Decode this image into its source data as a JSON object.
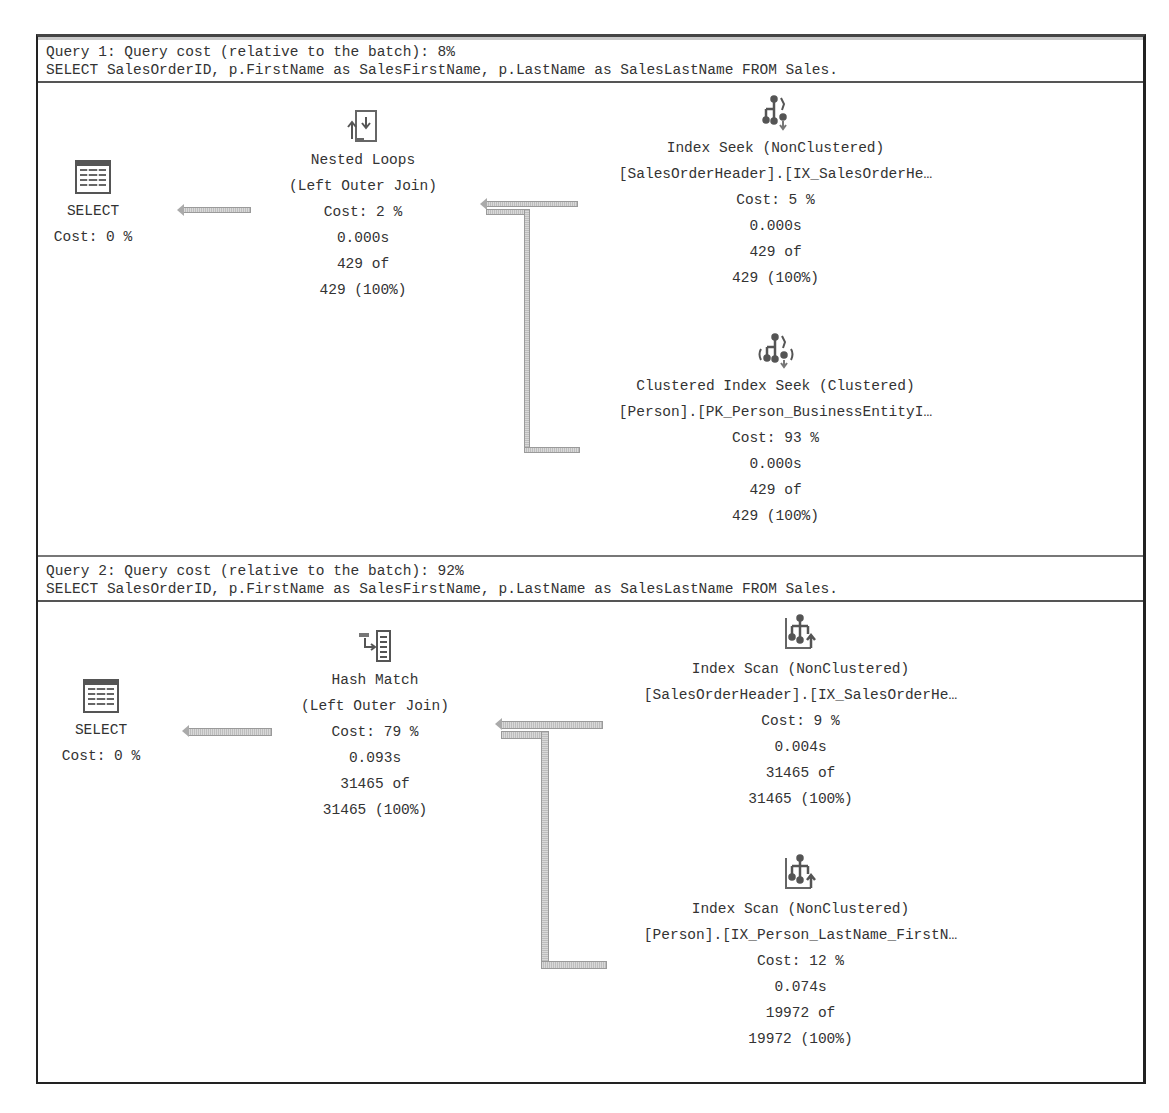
{
  "queries": [
    {
      "header": "Query 1: Query cost (relative to the batch): 8%",
      "sql": "SELECT SalesOrderID, p.FirstName as SalesFirstName, p.LastName as SalesLastName FROM Sales.",
      "select": {
        "label": "SELECT",
        "cost": "Cost: 0 %"
      },
      "join": {
        "name": "Nested Loops",
        "type": "(Left Outer Join)",
        "cost": "Cost: 2 %",
        "time": "0.000s",
        "rows": "429 of",
        "rows_pct": "429 (100%)"
      },
      "top": {
        "name": "Index Seek (NonClustered)",
        "object": "[SalesOrderHeader].[IX_SalesOrderHe…",
        "cost": "Cost: 5 %",
        "time": "0.000s",
        "rows": "429 of",
        "rows_pct": "429 (100%)"
      },
      "bottom": {
        "name": "Clustered Index Seek (Clustered)",
        "object": "[Person].[PK_Person_BusinessEntityI…",
        "cost": "Cost: 93 %",
        "time": "0.000s",
        "rows": "429 of",
        "rows_pct": "429 (100%)"
      }
    },
    {
      "header": "Query 2: Query cost (relative to the batch): 92%",
      "sql": "SELECT SalesOrderID, p.FirstName as SalesFirstName, p.LastName as SalesLastName FROM Sales.",
      "select": {
        "label": "SELECT",
        "cost": "Cost: 0 %"
      },
      "join": {
        "name": "Hash Match",
        "type": "(Left Outer Join)",
        "cost": "Cost: 79 %",
        "time": "0.093s",
        "rows": "31465 of",
        "rows_pct": "31465 (100%)"
      },
      "top": {
        "name": "Index Scan (NonClustered)",
        "object": "[SalesOrderHeader].[IX_SalesOrderHe…",
        "cost": "Cost: 9 %",
        "time": "0.004s",
        "rows": "31465 of",
        "rows_pct": "31465 (100%)"
      },
      "bottom": {
        "name": "Index Scan (NonClustered)",
        "object": "[Person].[IX_Person_LastName_FirstN…",
        "cost": "Cost: 12 %",
        "time": "0.074s",
        "rows": "19972 of",
        "rows_pct": "19972 (100%)"
      }
    }
  ]
}
